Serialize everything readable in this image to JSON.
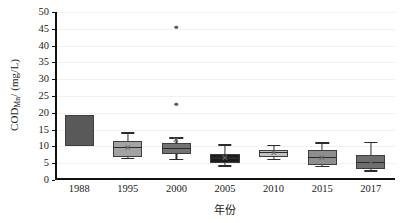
{
  "chart_data": {
    "type": "box",
    "title": "",
    "xlabel": "年份",
    "ylabel_html": "COD<sub>Mn</sub>/ (mg/L)",
    "ylabel": "CODMn/ (mg/L)",
    "categories": [
      "1988",
      "1995",
      "2000",
      "2005",
      "2010",
      "2015",
      "2017"
    ],
    "ylim": [
      0,
      50
    ],
    "yticks": [
      0,
      5,
      10,
      15,
      20,
      25,
      30,
      35,
      40,
      45,
      50
    ],
    "grid": true,
    "legend": "none",
    "boxes": [
      {
        "category": "1988",
        "q1": 10.0,
        "median": 14.5,
        "q3": 19.5,
        "whisker_low": 10.0,
        "whisker_high": 19.5,
        "mean": 14.5,
        "outliers": [],
        "color": "#595959",
        "show_whiskers": false,
        "show_median": false,
        "show_mean": false
      },
      {
        "category": "1995",
        "q1": 6.8,
        "median": 9.4,
        "q3": 11.5,
        "whisker_low": 6.2,
        "whisker_high": 13.8,
        "mean": 9.5,
        "outliers": [],
        "color": "#a3a3a3",
        "show_whiskers": true,
        "show_median": true,
        "show_mean": true
      },
      {
        "category": "2000",
        "q1": 7.8,
        "median": 9.3,
        "q3": 11.0,
        "whisker_low": 6.0,
        "whisker_high": 12.3,
        "mean": 12.0,
        "outliers": [
          22.5,
          45.5
        ],
        "color": "#727272",
        "show_whiskers": true,
        "show_median": true,
        "show_mean": true
      },
      {
        "category": "2005",
        "q1": 5.0,
        "median": 6.4,
        "q3": 7.8,
        "whisker_low": 4.0,
        "whisker_high": 10.2,
        "mean": 6.5,
        "outliers": [],
        "color": "#1c1c1c",
        "show_whiskers": true,
        "show_median": true,
        "show_mean": true
      },
      {
        "category": "2010",
        "q1": 6.8,
        "median": 7.9,
        "q3": 8.8,
        "whisker_low": 6.0,
        "whisker_high": 10.0,
        "mean": 7.9,
        "outliers": [],
        "color": "#c2c2c2",
        "show_whiskers": true,
        "show_median": true,
        "show_mean": true
      },
      {
        "category": "2015",
        "q1": 4.5,
        "median": 6.6,
        "q3": 9.0,
        "whisker_low": 3.8,
        "whisker_high": 10.8,
        "mean": 6.6,
        "outliers": [],
        "color": "#8e8e8e",
        "show_whiskers": true,
        "show_median": true,
        "show_mean": true
      },
      {
        "category": "2017",
        "q1": 3.3,
        "median": 5.1,
        "q3": 7.5,
        "whisker_low": 2.5,
        "whisker_high": 11.0,
        "mean": 5.2,
        "outliers": [],
        "color": "#6e6e6e",
        "show_whiskers": true,
        "show_median": true,
        "show_mean": true
      }
    ],
    "mean_marker_glyph": "✕"
  }
}
